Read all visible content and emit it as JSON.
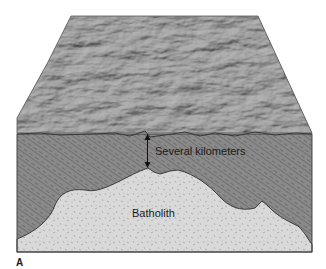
{
  "figure": {
    "panel_label": "A",
    "labels": {
      "depth": "Several kilometers",
      "batholith": "Batholith"
    },
    "colors": {
      "surface": "#8c8c8c",
      "surface_dark": "#5e5e5e",
      "country_rock": "#8a8a8a",
      "country_rock_stripe": "#4a4a4a",
      "batholith_fill": "#d9d9d9",
      "batholith_speckle": "#8f8f8f",
      "outline": "#2e2e2e",
      "text": "#1a1a1a"
    }
  }
}
